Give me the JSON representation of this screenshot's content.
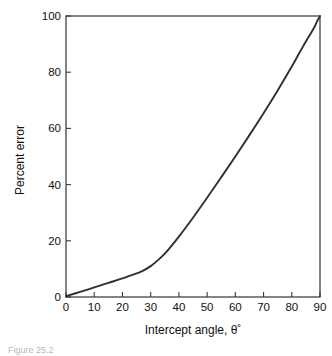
{
  "figure": {
    "caption_partial": "Figure 25.2",
    "background_color": "#ffffff",
    "curve_color": "#303030",
    "axis_color": "#3b3b3b",
    "text_color": "#111111"
  },
  "chart_data": {
    "type": "line",
    "title": "",
    "subtitle": "",
    "xlabel": "Intercept angle, θ˚",
    "ylabel": "Percent error",
    "xlim": [
      0,
      90
    ],
    "ylim": [
      0,
      100
    ],
    "grid": false,
    "legend": null,
    "legend_position": "none",
    "xticks": [
      0,
      10,
      20,
      30,
      40,
      50,
      60,
      70,
      80,
      90
    ],
    "xtick_labels": [
      "0",
      "10",
      "20",
      "30",
      "40",
      "50",
      "60",
      "70",
      "80",
      "90"
    ],
    "yticks": [
      0,
      20,
      40,
      60,
      80,
      100
    ],
    "ytick_labels": [
      "0",
      "20",
      "40",
      "60",
      "80",
      "100"
    ],
    "tick_direction": "in",
    "series": [
      {
        "name": "Percent error",
        "color": "#303030",
        "x": [
          0,
          5,
          10,
          15,
          20,
          25,
          27,
          30,
          32,
          35,
          40,
          45,
          50,
          55,
          60,
          65,
          70,
          75,
          80,
          82,
          84,
          86,
          88,
          89,
          90
        ],
        "y": [
          0.3,
          1.8,
          3.4,
          5.0,
          6.6,
          8.4,
          9.2,
          11.0,
          12.6,
          15.4,
          21.5,
          28.2,
          35.3,
          42.6,
          50.0,
          57.6,
          65.4,
          73.5,
          82.0,
          85.6,
          89.2,
          92.6,
          96.0,
          98.2,
          100.0
        ]
      }
    ],
    "annotations": []
  },
  "axes_geometry": {
    "left_px": 66,
    "right_px": 320,
    "top_px": 16,
    "bottom_px": 297
  }
}
